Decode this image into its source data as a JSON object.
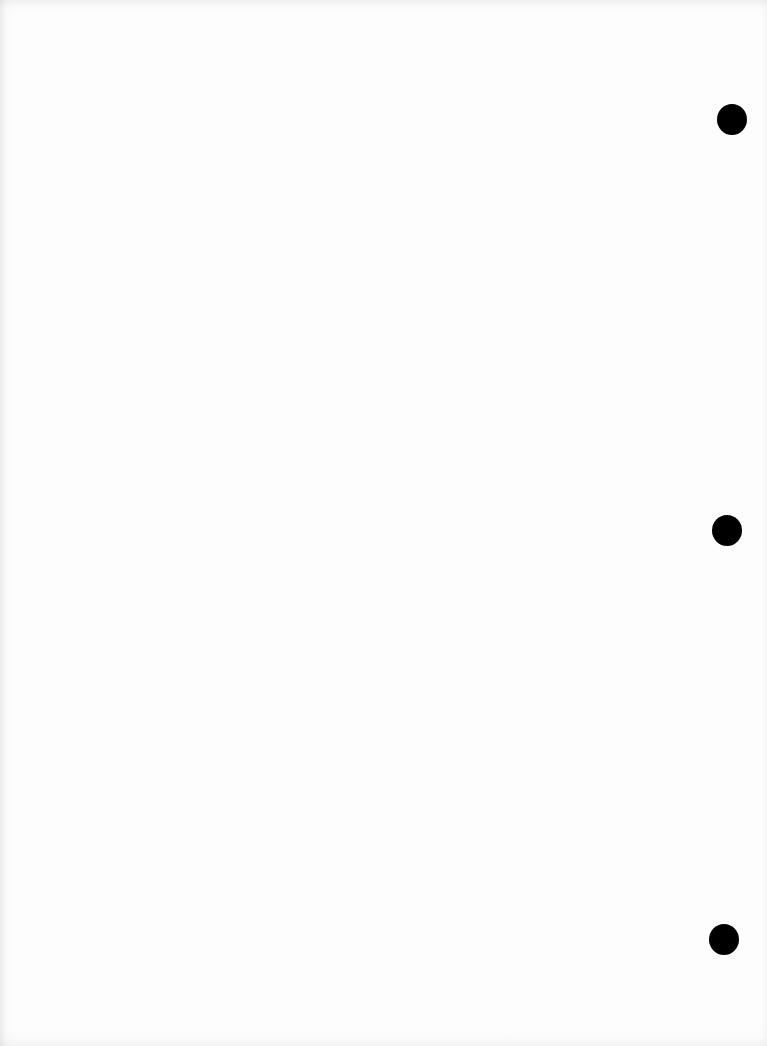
{
  "document": {
    "type": "blank scanned page",
    "paper_color": "#fdfdfd",
    "text_content": "",
    "punch_holes": [
      {
        "cx": 732,
        "cy": 119,
        "r": 15,
        "color": "#000000"
      },
      {
        "cx": 727,
        "cy": 530,
        "r": 15,
        "color": "#000000"
      },
      {
        "cx": 724,
        "cy": 939,
        "r": 15,
        "color": "#000000"
      }
    ]
  }
}
